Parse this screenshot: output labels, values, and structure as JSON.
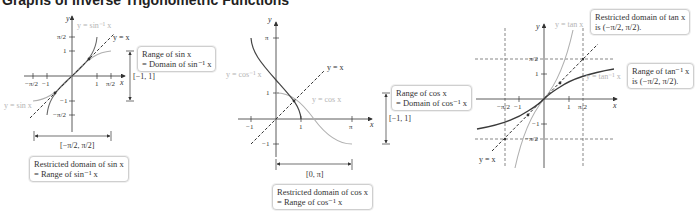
{
  "heading": "Graphs of Inverse Trigonometric Functions",
  "graphs": [
    {
      "name": "sine",
      "curve_labels": {
        "inverse": "y = sin⁻¹ x",
        "original": "y = sin x",
        "identity": "y = x"
      },
      "axis_labels": {
        "x": "x",
        "y": "y"
      },
      "x_ticks": [
        "−π/2",
        "−1",
        "1",
        "π/2"
      ],
      "y_ticks": [
        "π/2",
        "1",
        "−1",
        "−π/2"
      ],
      "bracket_vertical": "[−1, 1]",
      "bracket_horizontal": "[−π/2, π/2]",
      "box_range": {
        "line1": "Range of sin x",
        "line2": "= Domain of sin⁻¹ x"
      },
      "box_domain": {
        "line1": "Restricted domain of sin x",
        "line2": "= Range of sin⁻¹ x"
      }
    },
    {
      "name": "cosine",
      "curve_labels": {
        "inverse": "y = cos⁻¹ x",
        "original": "y = cos x",
        "identity": "y = x"
      },
      "axis_labels": {
        "x": "x",
        "y": "y"
      },
      "x_ticks": [
        "−1",
        "1",
        "π"
      ],
      "y_ticks": [
        "π",
        "1",
        "−1"
      ],
      "bracket_vertical": "[−1, 1]",
      "bracket_horizontal": "[0, π]",
      "box_range": {
        "line1": "Range of cos x",
        "line2": "= Domain of cos⁻¹ x"
      },
      "box_domain": {
        "line1": "Restricted domain of cos x",
        "line2": "= Range of cos⁻¹ x"
      }
    },
    {
      "name": "tangent",
      "curve_labels": {
        "inverse": "y = tan⁻¹ x",
        "original": "y = tan x",
        "identity": "y = x"
      },
      "axis_labels": {
        "x": "x",
        "y": "y"
      },
      "x_ticks": [
        "−π/2",
        "−1",
        "1",
        "π/2"
      ],
      "y_ticks": [
        "π/2",
        "1",
        "−1",
        "−π/2"
      ],
      "box_domain": {
        "line1": "Restricted domain of tan x",
        "line2": "is (−π/2, π/2)."
      },
      "box_range": {
        "line1": "Range of tan⁻¹ x",
        "line2": "is (−π/2, π/2)."
      }
    }
  ],
  "colors": {
    "inverse_curve": "#3a3a3a",
    "original_curve": "#b0b0b0",
    "axis": "#333333",
    "box_border": "#cfcfcf"
  }
}
